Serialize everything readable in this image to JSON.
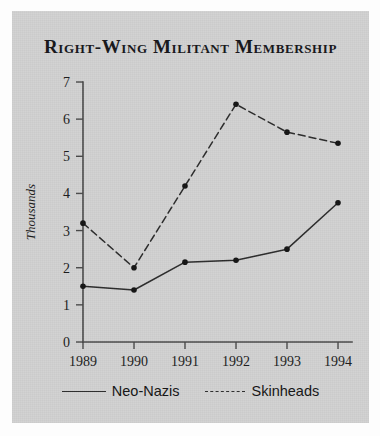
{
  "chart_data": {
    "type": "line",
    "title": "Right-Wing Militant Membership",
    "xlabel": "",
    "ylabel": "Thousands",
    "categories": [
      "1989",
      "1990",
      "1991",
      "1992",
      "1993",
      "1994"
    ],
    "series": [
      {
        "name": "Neo-Nazis",
        "style": "solid",
        "values": [
          1.5,
          1.4,
          2.15,
          2.2,
          2.5,
          3.75
        ]
      },
      {
        "name": "Skinheads",
        "style": "dashed",
        "values": [
          3.2,
          2.0,
          4.2,
          6.4,
          5.65,
          5.35
        ]
      }
    ],
    "ylim": [
      0,
      7
    ],
    "y_ticks": [
      "0",
      "1",
      "2",
      "3",
      "4",
      "5",
      "6",
      "7"
    ],
    "x_ticks": [
      "1989",
      "1990",
      "1991",
      "1992",
      "1993",
      "1994"
    ],
    "grid": false,
    "legend_position": "bottom",
    "colors": {
      "panel_background": "#d2d2d2",
      "figure_background": "#fdfdfd",
      "line": "#2b2b2b",
      "marker": "#141414",
      "axis": "#4a4a4a",
      "text": "#1b1b1b"
    }
  },
  "legend": {
    "entries": [
      {
        "label": "Neo-Nazis",
        "style": "solid"
      },
      {
        "label": "Skinheads",
        "style": "dashed"
      }
    ]
  }
}
